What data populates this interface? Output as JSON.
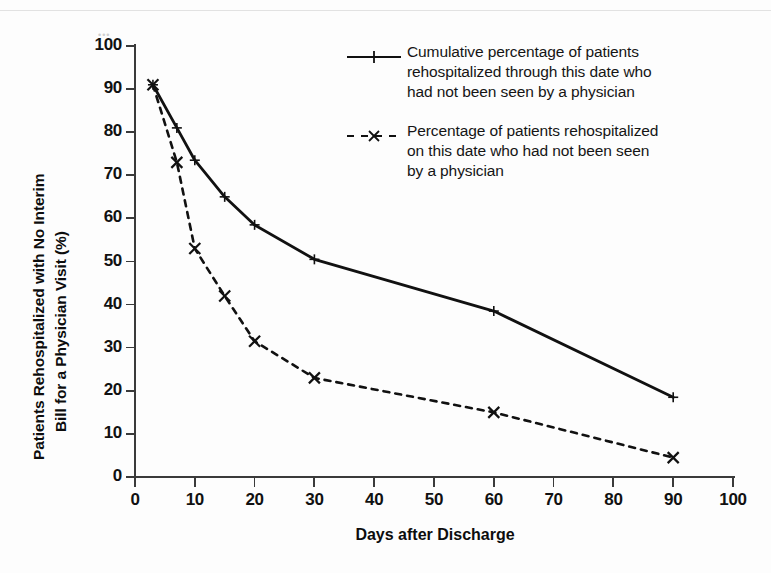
{
  "chart_data": {
    "type": "line",
    "title": "",
    "xlabel": "Days after Discharge",
    "ylabel": "Patients Rehospitalized with No Interim Bill for a Physician Visit (%)",
    "ylabel_lines": [
      "Patients Rehospitalized with No Interim",
      "Bill for a Physician Visit (%)"
    ],
    "xlim": [
      0,
      100
    ],
    "ylim": [
      0,
      100
    ],
    "xticks": [
      0,
      10,
      20,
      30,
      40,
      50,
      60,
      70,
      80,
      90,
      100
    ],
    "yticks": [
      0,
      10,
      20,
      30,
      40,
      50,
      60,
      70,
      80,
      90,
      100
    ],
    "xtick_labels": [
      "0",
      "10",
      "20",
      "30",
      "40",
      "50",
      "60",
      "70",
      "80",
      "90",
      "100"
    ],
    "ytick_labels": [
      "0",
      "10",
      "20",
      "30",
      "40",
      "50",
      "60",
      "70",
      "80",
      "90",
      "100"
    ],
    "grid": false,
    "legend_position": "top-right",
    "x": [
      3,
      7,
      10,
      15,
      20,
      30,
      60,
      90
    ],
    "series": [
      {
        "name": "Cumulative percentage of patients rehospitalized through this date who had not been seen by a physician",
        "style": "solid",
        "marker": "plus",
        "color": "#111111",
        "values": [
          91,
          81,
          73.5,
          65,
          58.5,
          50.5,
          38.5,
          18.5
        ]
      },
      {
        "name": "Percentage of patients rehospitalized on this date who had not been seen by a physician",
        "style": "dashed",
        "marker": "x",
        "color": "#111111",
        "values": [
          91,
          73,
          53,
          42,
          31.5,
          23,
          15,
          4.5
        ]
      }
    ]
  },
  "legend": {
    "entries": [
      {
        "key": "solid-plus",
        "lines": [
          "Cumulative percentage of patients",
          "rehospitalized through this date who",
          "had not been seen by a physician"
        ]
      },
      {
        "key": "dashed-x",
        "lines": [
          "Percentage of patients rehospitalized",
          "on this date who had not been seen",
          "by a physician"
        ]
      }
    ]
  },
  "artifacts": {
    "speck": "•••"
  }
}
